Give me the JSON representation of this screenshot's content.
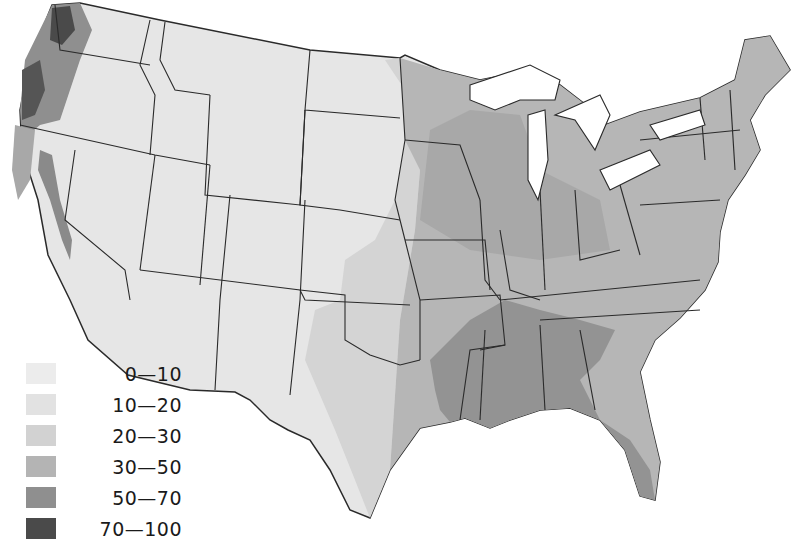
{
  "map": {
    "type": "choropleth",
    "region": "Contiguous United States",
    "colors": {
      "background": "#ffffff",
      "water": "#ffffff",
      "border": "#2a2a2a",
      "band_0_10": "#ececec",
      "band_10_20": "#e2e2e2",
      "band_20_30": "#d2d2d2",
      "band_30_50": "#b4b4b4",
      "band_50_70": "#8f8f8f",
      "band_70_100": "#4a4a4a"
    }
  },
  "legend": {
    "items": [
      {
        "label": "0—10",
        "color": "#ececec"
      },
      {
        "label": "10—20",
        "color": "#e2e2e2"
      },
      {
        "label": "20—30",
        "color": "#d2d2d2"
      },
      {
        "label": "30—50",
        "color": "#b4b4b4"
      },
      {
        "label": "50—70",
        "color": "#8f8f8f"
      },
      {
        "label": "70—100",
        "color": "#4a4a4a"
      }
    ]
  }
}
